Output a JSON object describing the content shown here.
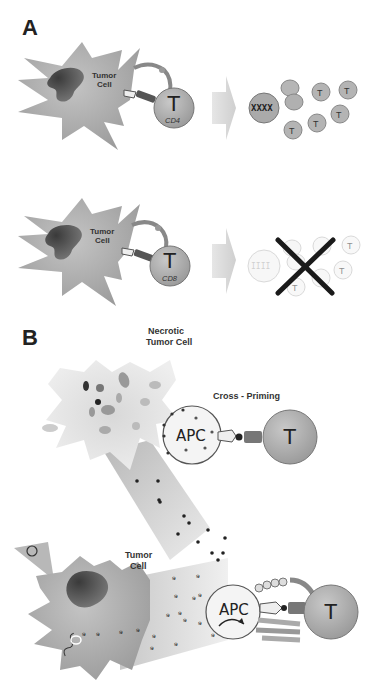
{
  "figure": {
    "panel_a": {
      "letter": "A",
      "row1": {
        "tumor_label_line1": "Tumor",
        "tumor_label_line2": "Cell",
        "tcell_letter": "T",
        "tcell_subtype": "CD4",
        "outcome": "proliferation",
        "progeny_letter": "T"
      },
      "row2": {
        "tumor_label_line1": "Tumor",
        "tumor_label_line2": "Cell",
        "tcell_letter": "T",
        "tcell_subtype": "CD8",
        "outcome": "no proliferation (crossed out)",
        "progeny_letter": "T"
      }
    },
    "panel_b": {
      "letter": "B",
      "necrotic_label_line1": "Necrotic",
      "necrotic_label_line2": "Tumor Cell",
      "cross_priming_label": "Cross - Priming",
      "apc_label": "APC",
      "tcell_letter": "T",
      "tumor_label_line1": "Tumor",
      "tumor_label_line2": "Cell"
    },
    "colors": {
      "tumor_gray": "#a8a8a8",
      "nucleus_dark": "#4a4a4a",
      "tcell_gray": "#b0b0b0",
      "apc_fill": "#f2f2f2",
      "arrow_gray": "#d8d8d8",
      "cross_black": "#1a1a1a"
    }
  }
}
